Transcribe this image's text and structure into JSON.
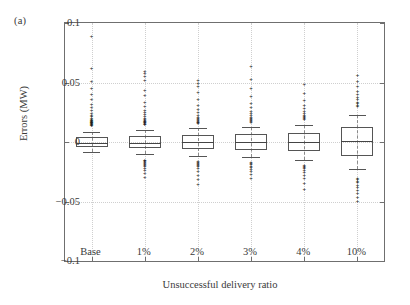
{
  "panel": {
    "label": "(a)"
  },
  "chart_data": {
    "type": "box",
    "title": "",
    "panel_label": "(a)",
    "xlabel": "Unsuccessful delivery ratio",
    "ylabel": "Errors (MW)",
    "categories": [
      "Base",
      "1%",
      "2%",
      "3%",
      "4%",
      "10%"
    ],
    "ylim": [
      -0.1,
      0.1
    ],
    "yticks": [
      0.1,
      0.05,
      0,
      -0.05,
      -0.1
    ],
    "ytick_labels": [
      "0.1",
      "0.05",
      "0",
      "−0.05",
      "−0.1"
    ],
    "grid": true,
    "legend": "none",
    "boxes": [
      {
        "category": "Base",
        "q1": -0.0045,
        "median": -0.0008,
        "q3": 0.0042,
        "whisker_low": -0.0085,
        "whisker_high": 0.008,
        "outliers_high": [
          0.014,
          0.0145,
          0.015,
          0.0155,
          0.016,
          0.0162,
          0.0165,
          0.0168,
          0.0172,
          0.0175,
          0.0178,
          0.0182,
          0.0188,
          0.0195,
          0.0205,
          0.0215,
          0.0228,
          0.0245,
          0.0265,
          0.029,
          0.032,
          0.036,
          0.0405,
          0.0455,
          0.051,
          0.062,
          0.089
        ],
        "outliers_low": []
      },
      {
        "category": "1%",
        "q1": -0.0052,
        "median": -0.0005,
        "q3": 0.005,
        "whisker_low": -0.01,
        "whisker_high": 0.0098,
        "outliers_high": [
          0.015,
          0.0155,
          0.016,
          0.0165,
          0.017,
          0.0175,
          0.018,
          0.0188,
          0.0195,
          0.0205,
          0.0218,
          0.0232,
          0.025,
          0.0272,
          0.03,
          0.034,
          0.0392,
          0.044,
          0.052,
          0.0555,
          0.058,
          0.06
        ],
        "outliers_low": [
          -0.015,
          -0.0155,
          -0.0162,
          -0.0168,
          -0.0175,
          -0.0182,
          -0.019,
          -0.02,
          -0.0215,
          -0.0235,
          -0.0262,
          -0.029
        ]
      },
      {
        "category": "2%",
        "q1": -0.006,
        "median": 0.0,
        "q3": 0.006,
        "whisker_low": -0.0118,
        "whisker_high": 0.0115,
        "outliers_high": [
          0.016,
          0.0165,
          0.017,
          0.0175,
          0.0182,
          0.019,
          0.02,
          0.0212,
          0.0228,
          0.0248,
          0.0275,
          0.031,
          0.036,
          0.042,
          0.047,
          0.0498,
          0.052
        ],
        "outliers_low": [
          -0.016,
          -0.0168,
          -0.0175,
          -0.0182,
          -0.0192,
          -0.0205,
          -0.0222,
          -0.0245,
          -0.0275,
          -0.031,
          -0.035
        ]
      },
      {
        "category": "3%",
        "q1": -0.0068,
        "median": 0.0002,
        "q3": 0.0068,
        "whisker_low": -0.013,
        "whisker_high": 0.0128,
        "outliers_high": [
          0.0172,
          0.0178,
          0.0185,
          0.0192,
          0.02,
          0.0212,
          0.0225,
          0.0242,
          0.0262,
          0.029,
          0.033,
          0.0385,
          0.045,
          0.053,
          0.064
        ],
        "outliers_low": [
          -0.0172,
          -0.018,
          -0.0188,
          -0.0198,
          -0.021,
          -0.0225,
          -0.0245,
          -0.027,
          -0.03
        ]
      },
      {
        "category": "4%",
        "q1": -0.0078,
        "median": 0.0002,
        "q3": 0.0078,
        "whisker_low": -0.0148,
        "whisker_high": 0.0145,
        "outliers_high": [
          0.019,
          0.0198,
          0.0208,
          0.0218,
          0.023,
          0.0245,
          0.0262,
          0.0285,
          0.0315,
          0.0355,
          0.0412,
          0.049
        ],
        "outliers_low": [
          -0.019,
          -0.0198,
          -0.0208,
          -0.022,
          -0.0235,
          -0.0252,
          -0.0275,
          -0.0305,
          -0.0345,
          -0.0395
        ]
      },
      {
        "category": "10%",
        "q1": -0.012,
        "median": 0.0005,
        "q3": 0.0122,
        "whisker_low": -0.0225,
        "whisker_high": 0.0228,
        "outliers_high": [
          0.03,
          0.0312,
          0.0325,
          0.034,
          0.0358,
          0.0378,
          0.0402,
          0.0432,
          0.0468,
          0.0512,
          0.0562
        ],
        "outliers_low": [
          -0.03,
          -0.0312,
          -0.0325,
          -0.034,
          -0.0358,
          -0.0378,
          -0.04,
          -0.0428,
          -0.046,
          -0.0498
        ]
      }
    ]
  }
}
